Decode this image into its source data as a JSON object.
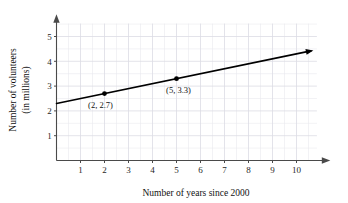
{
  "chart_data": {
    "type": "line",
    "title": "",
    "subtitle": "",
    "xlabel": "Number of years since 2000",
    "ylabel": "Number of volunteers\n(in millions)",
    "ylabel_line1": "Number of volunteers",
    "ylabel_line2": "(in millions)",
    "xlim": [
      0,
      11.2
    ],
    "ylim": [
      0,
      5.7
    ],
    "xticks": [
      1,
      2,
      3,
      4,
      5,
      6,
      7,
      8,
      9,
      10
    ],
    "xtick_labels": [
      "1",
      "2",
      "3",
      "4",
      "5",
      "6",
      "7",
      "8",
      "9",
      "10"
    ],
    "yticks": [
      1,
      2,
      3,
      4,
      5
    ],
    "ytick_labels": [
      "1",
      "2",
      "3",
      "4",
      "5"
    ],
    "grid": true,
    "grid_major_step_x": 1,
    "grid_major_step_y": 1,
    "grid_minor_step_x": 0.5,
    "grid_minor_step_y": 0.5,
    "legend": null,
    "legend_position": "none",
    "axis_arrows": {
      "x_right": true,
      "y_top": true
    },
    "line_color": "#000000",
    "grid_color": "#e3e3ea",
    "axis_color": "#4a4a4a",
    "series": [
      {
        "name": "volunteers",
        "line_start": {
          "x": 0,
          "y": 2.3
        },
        "line_end": {
          "x": 10.6,
          "y": 4.42
        },
        "slope": 0.2,
        "intercept": 2.3,
        "arrow_end": true,
        "points": [
          {
            "x": 2,
            "y": 2.7,
            "label": "(2, 2.7)"
          },
          {
            "x": 5,
            "y": 3.3,
            "label": "(5, 3.3)"
          }
        ]
      }
    ],
    "annotations": [
      {
        "text": "(2, 2.7)",
        "x": 2,
        "y": 2.7,
        "placement": "below-left"
      },
      {
        "text": "(5, 3.3)",
        "x": 5,
        "y": 3.3,
        "placement": "below-right"
      }
    ]
  }
}
